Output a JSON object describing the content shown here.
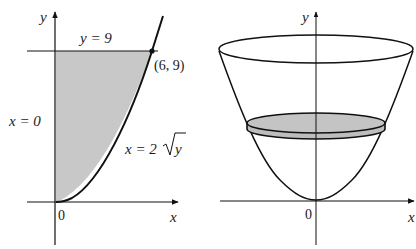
{
  "left_panel": {
    "y_axis_label": "y",
    "x_axis_label": "x",
    "origin_label": "0",
    "top_line_label": "y = 9",
    "point_label": "(6, 9)",
    "left_boundary_label": "x = 0",
    "curve_label_prefix": "x = 2",
    "curve_label_radicand": "y",
    "region_fill": "#c8c8c8"
  },
  "right_panel": {
    "y_axis_label": "y",
    "x_axis_label": "x",
    "origin_label": "0",
    "disk_fill": "#c4c4c4"
  },
  "colors": {
    "line": "#111111",
    "background": "#ffffff"
  }
}
